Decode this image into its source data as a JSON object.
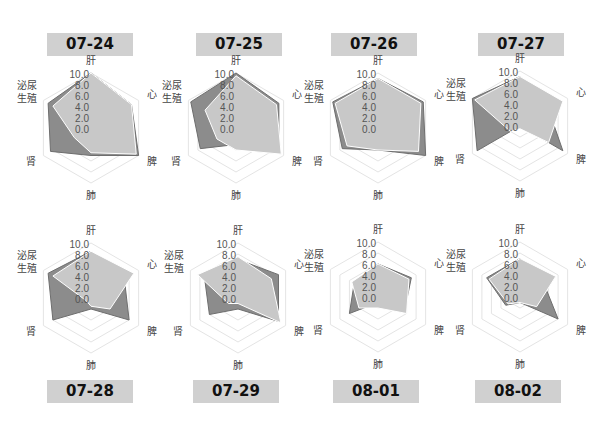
{
  "title": "",
  "colors": {
    "series_dark": "#8c8c8c",
    "series_dark_stroke": "#6e6e6e",
    "series_light": "#c8c8c8",
    "series_light_stroke": "#ffffff",
    "grid": "#e4e4e4",
    "label_bg": "#d0d0d0"
  },
  "chart_data": [
    {
      "type": "radar",
      "title": "07-24",
      "axes": [
        "肝",
        "心",
        "脾",
        "肺",
        "肾",
        "泌尿生殖"
      ],
      "ticks": [
        "10.0",
        "8.0",
        "6.0",
        "4.0",
        "2.0",
        "0.0"
      ],
      "rlim": [
        0,
        10
      ],
      "series": [
        {
          "name": "series-dark",
          "values": [
            10,
            8.5,
            10,
            5,
            8.5,
            9
          ]
        },
        {
          "name": "series-light",
          "values": [
            10,
            8.5,
            9.5,
            4.5,
            3.5,
            8
          ]
        }
      ]
    },
    {
      "type": "radar",
      "title": "07-25",
      "axes": [
        "肝",
        "心",
        "脾",
        "肺",
        "肾",
        "泌尿生殖"
      ],
      "ticks": [
        "10.0",
        "8.0",
        "6.0",
        "4.0",
        "2.0",
        "0.0"
      ],
      "rlim": [
        0,
        10
      ],
      "series": [
        {
          "name": "series-dark",
          "values": [
            10,
            9,
            9,
            3,
            7.5,
            9.5
          ]
        },
        {
          "name": "series-light",
          "values": [
            9.5,
            8.5,
            9.5,
            4,
            4,
            6.5
          ]
        }
      ]
    },
    {
      "type": "radar",
      "title": "07-26",
      "axes": [
        "肝",
        "心",
        "脾",
        "肺",
        "肾",
        "泌尿生殖"
      ],
      "ticks": [
        "10.0",
        "8.0",
        "6.0",
        "4.0",
        "2.0",
        "0.0"
      ],
      "rlim": [
        0,
        10
      ],
      "series": [
        {
          "name": "series-dark",
          "values": [
            9,
            9.5,
            10,
            4,
            7.5,
            9.5
          ]
        },
        {
          "name": "series-light",
          "values": [
            9,
            9,
            8.5,
            4,
            6.5,
            9
          ]
        }
      ]
    },
    {
      "type": "radar",
      "title": "07-27",
      "axes": [
        "肝",
        "心",
        "脾",
        "肺",
        "肾",
        "泌尿生殖"
      ],
      "ticks": [
        "10.0",
        "8.0",
        "6.0",
        "4.0",
        "2.0",
        "0.0"
      ],
      "rlim": [
        0,
        10
      ],
      "series": [
        {
          "name": "series-dark",
          "values": [
            9,
            6,
            9,
            0,
            9,
            10
          ]
        },
        {
          "name": "series-light",
          "values": [
            9,
            9,
            6,
            0.5,
            2,
            9.5
          ]
        }
      ]
    },
    {
      "type": "radar",
      "title": "07-28",
      "axes": [
        "肝",
        "心",
        "脾",
        "肺",
        "肾",
        "泌尿生殖"
      ],
      "ticks": [
        "10.0",
        "8.0",
        "6.0",
        "4.0",
        "2.0",
        "0.0"
      ],
      "rlim": [
        0,
        10
      ],
      "series": [
        {
          "name": "series-dark",
          "values": [
            8.5,
            7,
            8,
            2,
            8,
            9
          ]
        },
        {
          "name": "series-light",
          "values": [
            8.5,
            9,
            4,
            1.5,
            1,
            8
          ]
        }
      ]
    },
    {
      "type": "radar",
      "title": "07-29",
      "axes": [
        "肝",
        "心",
        "脾",
        "肺",
        "肾",
        "泌尿生殖"
      ],
      "ticks": [
        "10.0",
        "8.0",
        "6.0",
        "4.0",
        "2.0",
        "0.0"
      ],
      "rlim": [
        0,
        10
      ],
      "series": [
        {
          "name": "series-dark",
          "values": [
            7,
            8.5,
            8.5,
            2,
            6,
            7
          ]
        },
        {
          "name": "series-light",
          "values": [
            7.5,
            7,
            9,
            1,
            2,
            8.5
          ]
        }
      ]
    },
    {
      "type": "radar",
      "title": "08-01",
      "axes": [
        "肝",
        "心",
        "脾",
        "肺",
        "肾",
        "泌尿生殖"
      ],
      "ticks": [
        "10.0",
        "8.0",
        "6.0",
        "4.0",
        "2.0",
        "0.0"
      ],
      "rlim": [
        0,
        10
      ],
      "series": [
        {
          "name": "series-dark",
          "values": [
            6,
            7,
            5.5,
            1,
            6,
            5
          ]
        },
        {
          "name": "series-light",
          "values": [
            6,
            6.5,
            6,
            2,
            4,
            5.5
          ]
        }
      ]
    },
    {
      "type": "radar",
      "title": "08-02",
      "axes": [
        "肝",
        "心",
        "脾",
        "肺",
        "肾",
        "泌尿生殖"
      ],
      "ticks": [
        "10.0",
        "8.0",
        "6.0",
        "4.0",
        "2.0",
        "0.0"
      ],
      "rlim": [
        0,
        10
      ],
      "series": [
        {
          "name": "series-dark",
          "values": [
            7,
            5,
            8,
            1,
            3,
            7
          ]
        },
        {
          "name": "series-light",
          "values": [
            7,
            7.5,
            3.5,
            1,
            2.5,
            6.5
          ]
        }
      ]
    }
  ],
  "labels": {
    "axis_labels": [
      "肝",
      "心",
      "脾",
      "肺",
      "肾",
      "泌尿\n生殖"
    ],
    "dates": [
      "07-24",
      "07-25",
      "07-26",
      "07-27",
      "07-28",
      "07-29",
      "08-01",
      "08-02"
    ]
  }
}
